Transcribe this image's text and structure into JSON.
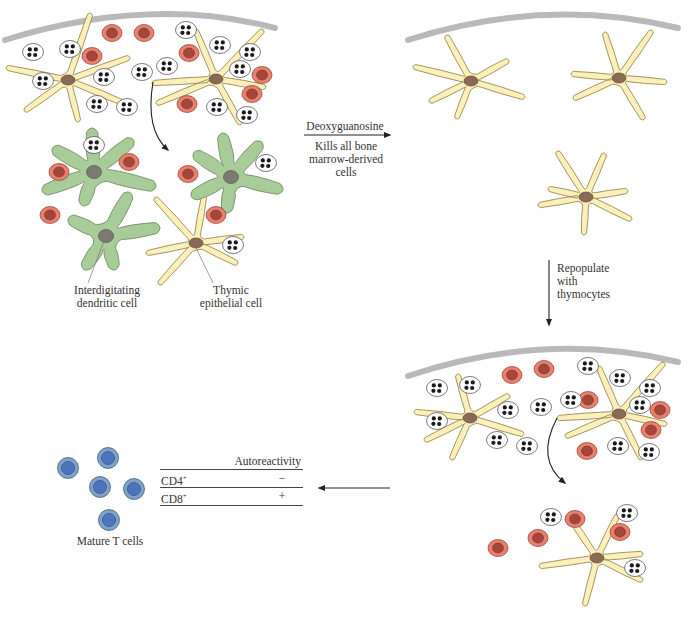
{
  "colors": {
    "capsule": "#b9b9b9",
    "epithelial_fill": "#fbefbb",
    "epithelial_stroke": "#9a8a4e",
    "nucleus_brown": "#8a6a55",
    "dendritic_fill": "#a8cc98",
    "dendritic_stroke": "#6f8f62",
    "dendritic_nucleus": "#7a7a72",
    "red_cell_fill": "#e9806e",
    "red_cell_nucleus": "#a4473a",
    "thymocyte_fill": "#ffffff",
    "thymocyte_dot": "#1a1a1a",
    "tcell_outer": "#7ea3c5",
    "tcell_inner": "#4d74bf",
    "arrow": "#222222"
  },
  "labels": {
    "dendritic_cell": [
      "Interdigitating",
      "dendritic cell"
    ],
    "epithelial_cell": [
      "Thymic",
      "epithelial cell"
    ],
    "step1_arrow_label": "Deoxyguanosine",
    "step1_note": [
      "Kills all bone",
      "marrow-derived",
      "cells"
    ],
    "step2_note": [
      "Repopulate",
      "with",
      "thymocytes"
    ],
    "mature_t_cells": "Mature T cells"
  },
  "table": {
    "header": "Autoreactivity",
    "rows": [
      {
        "cell": "CD4",
        "sup": "+",
        "autoreactivity": "−"
      },
      {
        "cell": "CD8",
        "sup": "+",
        "autoreactivity": "+"
      }
    ]
  },
  "panels": {
    "top_left": {
      "capsule": {
        "x1": 5,
        "y1": 40,
        "cx": 150,
        "cy": -5,
        "x2": 275,
        "y2": 28
      },
      "epithelial": [
        {
          "x": 68,
          "y": 80,
          "arms": [
            [
              -60,
              -12
            ],
            [
              -42,
              30
            ],
            [
              22,
              -65
            ],
            [
              60,
              -22
            ],
            [
              58,
              24
            ],
            [
              10,
              40
            ]
          ]
        },
        {
          "x": 216,
          "y": 79,
          "arms": [
            [
              -62,
              4
            ],
            [
              -58,
              24
            ],
            [
              -20,
              -48
            ],
            [
              46,
              -48
            ],
            [
              48,
              8
            ],
            [
              24,
              44
            ]
          ]
        }
      ],
      "thymocytes": [
        [
          33,
          52
        ],
        [
          70,
          49
        ],
        [
          43,
          81
        ],
        [
          104,
          77
        ],
        [
          97,
          104
        ],
        [
          127,
          107
        ],
        [
          142,
          72
        ],
        [
          167,
          66
        ],
        [
          186,
          30
        ],
        [
          220,
          45
        ],
        [
          250,
          52
        ],
        [
          240,
          69
        ],
        [
          217,
          107
        ],
        [
          247,
          115
        ]
      ],
      "red_cells": [
        [
          92,
          56
        ],
        [
          112,
          33
        ],
        [
          144,
          33
        ],
        [
          189,
          53
        ],
        [
          262,
          75
        ],
        [
          252,
          94
        ],
        [
          187,
          104
        ]
      ]
    },
    "top_left_lower": {
      "dendritic": [
        {
          "x": 94,
          "y": 172,
          "arms": [
            [
              -38,
              -22
            ],
            [
              -48,
              18
            ],
            [
              -10,
              30
            ],
            [
              36,
              -30
            ],
            [
              58,
              14
            ],
            [
              -2,
              -40
            ]
          ]
        },
        {
          "x": 231,
          "y": 177,
          "arms": [
            [
              -34,
              -22
            ],
            [
              -36,
              18
            ],
            [
              -4,
              32
            ],
            [
              28,
              -32
            ],
            [
              48,
              12
            ],
            [
              -8,
              -40
            ]
          ]
        },
        {
          "x": 106,
          "y": 236,
          "arms": [
            [
              -34,
              -16
            ],
            [
              -20,
              30
            ],
            [
              8,
              30
            ],
            [
              22,
              -40
            ],
            [
              50,
              -8
            ]
          ]
        }
      ],
      "epithelial": [
        {
          "x": 196,
          "y": 243,
          "arms": [
            [
              -40,
              -44
            ],
            [
              -48,
              10
            ],
            [
              -36,
              40
            ],
            [
              8,
              -46
            ],
            [
              46,
              -6
            ],
            [
              40,
              20
            ]
          ]
        }
      ],
      "thymocytes": [
        [
          94,
          145
        ],
        [
          266,
          163
        ],
        [
          233,
          245
        ]
      ],
      "red_cells": [
        [
          59,
          172
        ],
        [
          129,
          162
        ],
        [
          188,
          174
        ],
        [
          50,
          215
        ],
        [
          216,
          215
        ]
      ]
    },
    "top_right": {
      "capsule": {
        "x1": 408,
        "y1": 40,
        "cx": 545,
        "cy": -4,
        "x2": 678,
        "y2": 28
      },
      "epithelial": [
        {
          "x": 471,
          "y": 81,
          "arms": [
            [
              -56,
              -14
            ],
            [
              -40,
              20
            ],
            [
              -24,
              -44
            ],
            [
              36,
              -20
            ],
            [
              52,
              16
            ],
            [
              -14,
              36
            ]
          ]
        },
        {
          "x": 619,
          "y": 78,
          "arms": [
            [
              -46,
              -4
            ],
            [
              -44,
              20
            ],
            [
              -14,
              -44
            ],
            [
              32,
              -46
            ],
            [
              46,
              4
            ],
            [
              24,
              40
            ]
          ]
        },
        {
          "x": 586,
          "y": 197,
          "arms": [
            [
              -46,
              8
            ],
            [
              -28,
              -44
            ],
            [
              18,
              -42
            ],
            [
              40,
              -6
            ],
            [
              44,
              22
            ],
            [
              -2,
              36
            ],
            [
              -36,
              -8
            ]
          ]
        }
      ]
    },
    "bottom_right": {
      "capsule": {
        "x1": 408,
        "y1": 376,
        "cx": 545,
        "cy": 330,
        "x2": 678,
        "y2": 362
      },
      "epithelial": [
        {
          "x": 470,
          "y": 418,
          "arms": [
            [
              -54,
              -6
            ],
            [
              -44,
              22
            ],
            [
              -12,
              -42
            ],
            [
              38,
              -22
            ],
            [
              52,
              16
            ],
            [
              -18,
              40
            ]
          ]
        },
        {
          "x": 619,
          "y": 414,
          "arms": [
            [
              -60,
              4
            ],
            [
              -52,
              22
            ],
            [
              -20,
              -46
            ],
            [
              44,
              -50
            ],
            [
              46,
              10
            ],
            [
              22,
              44
            ]
          ]
        },
        {
          "x": 597,
          "y": 558,
          "arms": [
            [
              -56,
              8
            ],
            [
              -28,
              -42
            ],
            [
              20,
              -42
            ],
            [
              44,
              -4
            ],
            [
              44,
              22
            ],
            [
              -12,
              46
            ]
          ]
        }
      ],
      "thymocytes": [
        [
          437,
          388
        ],
        [
          470,
          385
        ],
        [
          437,
          421
        ],
        [
          508,
          410
        ],
        [
          497,
          440
        ],
        [
          527,
          446
        ],
        [
          541,
          407
        ],
        [
          571,
          400
        ],
        [
          588,
          366
        ],
        [
          620,
          378
        ],
        [
          650,
          388
        ],
        [
          640,
          405
        ],
        [
          618,
          446
        ],
        [
          649,
          452
        ],
        [
          551,
          517
        ],
        [
          627,
          513
        ],
        [
          635,
          568
        ]
      ],
      "red_cells": [
        [
          512,
          375
        ],
        [
          544,
          369
        ],
        [
          588,
          400
        ],
        [
          660,
          410
        ],
        [
          651,
          430
        ],
        [
          587,
          451
        ],
        [
          498,
          548
        ],
        [
          538,
          538
        ],
        [
          575,
          519
        ],
        [
          620,
          532
        ]
      ]
    }
  },
  "t_cells": [
    [
      108,
      458
    ],
    [
      68,
      468
    ],
    [
      100,
      487
    ],
    [
      134,
      489
    ],
    [
      109,
      520
    ]
  ],
  "arrows": {
    "curve_top": {
      "d": "M 153 82 Q 145 130 168 150"
    },
    "curve_bottom": {
      "d": "M 557 418 Q 535 460 565 483"
    },
    "step1": {
      "x1": 304,
      "y1": 135,
      "x2": 390,
      "y2": 135
    },
    "step2": {
      "x1": 549,
      "y1": 260,
      "x2": 549,
      "y2": 325
    },
    "step3": {
      "x1": 390,
      "y1": 488,
      "x2": 319,
      "y2": 488
    }
  }
}
